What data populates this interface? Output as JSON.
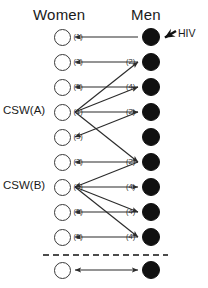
{
  "figure": {
    "width": 208,
    "height": 288,
    "background": "#ffffff",
    "headers": {
      "women": "Women",
      "men": "Men"
    },
    "external_source": {
      "label": "HIV",
      "arrow_target": "man-1",
      "icon": "arrow-left-icon"
    },
    "separator": {
      "style": "dashed",
      "color": "#111111",
      "y": 255
    }
  },
  "colors": {
    "female_node_fill": "#ffffff",
    "female_node_stroke": "#3a3a3a",
    "male_node_fill": "#111111",
    "edge": "#2b2b2b",
    "text": "#1a1a1a"
  },
  "women": [
    {
      "id": "woman-1",
      "label": "(1)",
      "y": 37,
      "group": ""
    },
    {
      "id": "woman-2",
      "label": "(3)",
      "y": 62,
      "group": ""
    },
    {
      "id": "woman-3",
      "label": "(5)",
      "y": 87,
      "group": ""
    },
    {
      "id": "woman-4",
      "label": "(1)",
      "y": 112,
      "group": "CSW(A)"
    },
    {
      "id": "woman-5",
      "label": "(3)",
      "y": 137,
      "group": ""
    },
    {
      "id": "woman-6",
      "label": "(3)",
      "y": 162,
      "group": ""
    },
    {
      "id": "woman-7",
      "label": "(3)",
      "y": 187,
      "group": "CSW(B)"
    },
    {
      "id": "woman-8",
      "label": "(5)",
      "y": 212,
      "group": ""
    },
    {
      "id": "woman-9",
      "label": "(5)",
      "y": 237,
      "group": ""
    },
    {
      "id": "woman-10",
      "label": "",
      "y": 270,
      "group": ""
    }
  ],
  "men": [
    {
      "id": "man-1",
      "label": "",
      "y": 37
    },
    {
      "id": "man-2",
      "label": "(2)",
      "y": 62
    },
    {
      "id": "man-3",
      "label": "(4)",
      "y": 87
    },
    {
      "id": "man-4",
      "label": "(2)",
      "y": 112
    },
    {
      "id": "man-5",
      "label": "",
      "y": 137
    },
    {
      "id": "man-6",
      "label": "(2)",
      "y": 162
    },
    {
      "id": "man-7",
      "label": "(4)",
      "y": 187
    },
    {
      "id": "man-8",
      "label": "(4)",
      "y": 212
    },
    {
      "id": "man-9",
      "label": "(4)",
      "y": 237
    },
    {
      "id": "man-10",
      "label": "",
      "y": 270
    }
  ],
  "edges": [
    {
      "from": "man-1",
      "to": "woman-1",
      "direction": "to-woman"
    },
    {
      "from": "man-2",
      "to": "woman-2",
      "direction": "to-woman"
    },
    {
      "from": "man-3",
      "to": "woman-3",
      "direction": "to-woman"
    },
    {
      "from": "woman-4",
      "to": "man-3",
      "direction": "to-man"
    },
    {
      "from": "woman-4",
      "to": "man-4",
      "direction": "to-man"
    },
    {
      "from": "woman-4",
      "to": "man-2",
      "direction": "to-man"
    },
    {
      "from": "man-4",
      "to": "woman-5",
      "direction": "to-woman"
    },
    {
      "from": "woman-4",
      "to": "man-6",
      "direction": "to-man"
    },
    {
      "from": "man-6",
      "to": "woman-6",
      "direction": "to-woman"
    },
    {
      "from": "man-6",
      "to": "woman-7",
      "direction": "to-woman"
    },
    {
      "from": "woman-7",
      "to": "man-7",
      "direction": "to-man"
    },
    {
      "from": "woman-7",
      "to": "man-8",
      "direction": "to-man"
    },
    {
      "from": "man-8",
      "to": "woman-8",
      "direction": "to-woman"
    },
    {
      "from": "woman-7",
      "to": "man-9",
      "direction": "to-man"
    },
    {
      "from": "man-9",
      "to": "woman-9",
      "direction": "to-woman"
    },
    {
      "from": "man-10",
      "to": "woman-10",
      "direction": "bidirectional"
    }
  ],
  "geometry": {
    "female_cx": 62,
    "male_cx": 151,
    "female_r": 8.5,
    "male_r": 9
  }
}
